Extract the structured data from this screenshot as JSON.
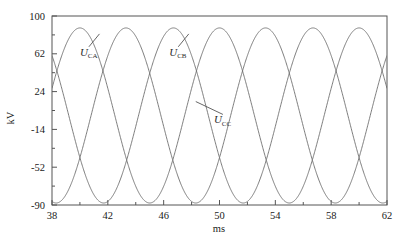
{
  "chart_data": {
    "type": "line",
    "title": "",
    "xlabel": "ms",
    "ylabel": "kV",
    "xlim": [
      38,
      62
    ],
    "ylim": [
      -90,
      100
    ],
    "grid": false,
    "legend": "inline-annotations",
    "xticks": [
      38,
      42,
      46,
      50,
      54,
      58,
      62
    ],
    "xtick_labels": [
      "38",
      "42",
      "46",
      "50",
      "54",
      "58",
      "62"
    ],
    "yticks": [
      -90,
      -52,
      -14,
      24,
      62,
      100
    ],
    "ytick_labels": [
      "-90",
      "-52",
      "-14",
      "24",
      "62",
      "100"
    ],
    "x_minor_step": 2,
    "y_minor_step": 19,
    "waveform": {
      "amplitude_kv": 88,
      "period_ms": 10,
      "frequency_hz": 100,
      "peak_value_kv": 88,
      "trough_value_kv": -88
    },
    "series": [
      {
        "name": "U_CA",
        "label_base": "U",
        "label_sub": "CA",
        "color": "#6e6e6e",
        "amplitude": 88,
        "period": 10,
        "peak_time_ms": 40.0,
        "phase_deg": 0,
        "value_at_38ms": 71.2,
        "label_x_ms": 40.0,
        "label_y_kv": 60,
        "leader_to_x_ms": 41.4,
        "leader_to_y_kv": 82
      },
      {
        "name": "U_CB",
        "label_base": "U",
        "label_sub": "CB",
        "color": "#6e6e6e",
        "amplitude": 88,
        "period": 10,
        "peak_time_ms": 46.7,
        "phase_deg": 120,
        "value_at_38ms": -84.6,
        "label_x_ms": 46.4,
        "label_y_kv": 60,
        "leader_to_x_ms": 47.8,
        "leader_to_y_kv": 82
      },
      {
        "name": "U_CC",
        "label_base": "U",
        "label_sub": "CC",
        "color": "#6e6e6e",
        "amplitude": 88,
        "period": 10,
        "peak_time_ms": 43.3,
        "phase_deg": 240,
        "value_at_38ms": 4.6,
        "label_x_ms": 49.6,
        "label_y_kv": -8,
        "leader_to_x_ms": 48.3,
        "leader_to_y_kv": 14
      }
    ]
  },
  "axes": {
    "x_axis_title": "ms",
    "y_axis_title": "kV",
    "frame_color": "#555555"
  }
}
